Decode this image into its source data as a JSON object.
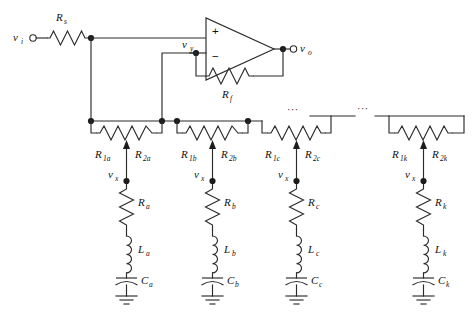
{
  "diagram": {
    "background_color": "#ffffff",
    "line_color": "#2b2b2b",
    "nodes": {
      "input_terminal": "v",
      "input_terminal_sub": "i",
      "output_terminal": "v",
      "output_terminal_sub": "o",
      "inverting_node": "v",
      "inverting_node_sub": "y",
      "tap_node": "v",
      "tap_node_sub": "x"
    },
    "opamp": {
      "plus_sign": "+",
      "minus_sign": "−",
      "name": "operational-amplifier"
    },
    "series_resistor": {
      "symbol": "R",
      "subscript": "s"
    },
    "feedback_resistor": {
      "symbol": "R",
      "subscript": "f"
    },
    "ellipsis": "···",
    "branches": [
      {
        "id": "a",
        "pot_left": {
          "symbol": "R",
          "subscript": "1a"
        },
        "pot_right": {
          "symbol": "R",
          "subscript": "2a"
        },
        "tap": {
          "symbol": "v",
          "subscript": "x"
        },
        "resistor": {
          "symbol": "R",
          "subscript": "a"
        },
        "inductor": {
          "symbol": "L",
          "subscript": "a"
        },
        "capacitor": {
          "symbol": "C",
          "subscript": "a"
        }
      },
      {
        "id": "b",
        "pot_left": {
          "symbol": "R",
          "subscript": "1b"
        },
        "pot_right": {
          "symbol": "R",
          "subscript": "2b"
        },
        "tap": {
          "symbol": "v",
          "subscript": "x"
        },
        "resistor": {
          "symbol": "R",
          "subscript": "b"
        },
        "inductor": {
          "symbol": "L",
          "subscript": "b"
        },
        "capacitor": {
          "symbol": "C",
          "subscript": "b"
        }
      },
      {
        "id": "c",
        "pot_left": {
          "symbol": "R",
          "subscript": "1c"
        },
        "pot_right": {
          "symbol": "R",
          "subscript": "2c"
        },
        "tap": {
          "symbol": "v",
          "subscript": "x"
        },
        "resistor": {
          "symbol": "R",
          "subscript": "c"
        },
        "inductor": {
          "symbol": "L",
          "subscript": "c"
        },
        "capacitor": {
          "symbol": "C",
          "subscript": "c"
        }
      },
      {
        "id": "k",
        "pot_left": {
          "symbol": "R",
          "subscript": "1k"
        },
        "pot_right": {
          "symbol": "R",
          "subscript": "2k"
        },
        "tap": {
          "symbol": "v",
          "subscript": "x"
        },
        "resistor": {
          "symbol": "R",
          "subscript": "k"
        },
        "inductor": {
          "symbol": "L",
          "subscript": "k"
        },
        "capacitor": {
          "symbol": "C",
          "subscript": "k"
        }
      }
    ]
  }
}
